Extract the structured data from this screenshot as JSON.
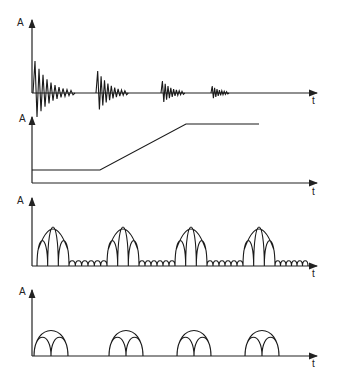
{
  "figure": {
    "panels": [
      {
        "id": "p1",
        "ylabel": "A",
        "xlabel": "t",
        "description": "Four decaying oscillation bursts of decreasing amplitude"
      },
      {
        "id": "p2",
        "ylabel": "A",
        "xlabel": "t",
        "description": "Constant low level, linear ramp, then constant high level"
      },
      {
        "id": "p3",
        "ylabel": "A",
        "xlabel": "t",
        "description": "Four bursts of three rectified lobes under an arched envelope, separated by small ripples"
      },
      {
        "id": "p4",
        "ylabel": "A",
        "xlabel": "t",
        "description": "Four arched envelopes each enclosing two overlapping smaller arches"
      }
    ]
  },
  "colors": {
    "line": "#1a1a1a",
    "background": "#ffffff"
  }
}
